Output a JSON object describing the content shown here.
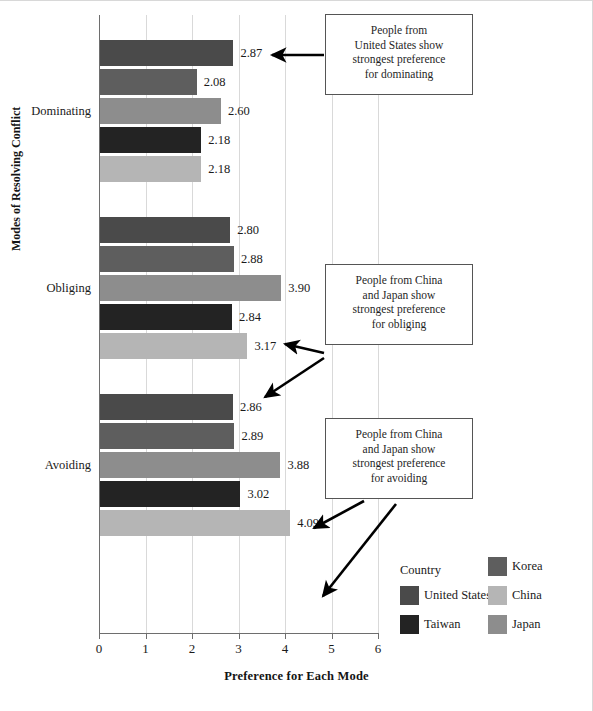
{
  "chart_data": {
    "type": "bar",
    "orientation": "horizontal",
    "title": "",
    "xlabel": "Preference for Each Mode",
    "ylabel": "Modes of Resolving Conflict",
    "categories": [
      "Dominating",
      "Obliging",
      "Avoiding"
    ],
    "xlim": [
      0,
      6
    ],
    "xticks": [
      "0",
      "1",
      "2",
      "3",
      "4",
      "5",
      "6"
    ],
    "grid": true,
    "legend_position": "bottom-right",
    "legend_title": "Country",
    "series": [
      {
        "name": "United States",
        "color": "#4a4a4a",
        "values": [
          2.87,
          2.8,
          2.86
        ]
      },
      {
        "name": "Korea",
        "color": "#5e5e5e",
        "values": [
          2.08,
          2.88,
          2.89
        ]
      },
      {
        "name": "Japan",
        "color": "#8d8d8d",
        "values": [
          2.6,
          3.9,
          3.88
        ]
      },
      {
        "name": "Taiwan",
        "color": "#232323",
        "values": [
          2.18,
          2.84,
          3.02
        ]
      },
      {
        "name": "China",
        "color": "#b5b5b5",
        "values": [
          2.18,
          3.17,
          4.09
        ]
      }
    ],
    "bar_value_labels": [
      [
        "2.87",
        "2.08",
        "2.60",
        "2.18",
        "2.18"
      ],
      [
        "2.80",
        "2.88",
        "3.90",
        "2.84",
        "3.17"
      ],
      [
        "2.86",
        "2.89",
        "3.88",
        "3.02",
        "4.09"
      ]
    ],
    "annotations": [
      {
        "id": "dominating-note",
        "lines": [
          "People from",
          "United States show",
          "strongest preference",
          "for dominating"
        ],
        "points_to": [
          "2.87"
        ]
      },
      {
        "id": "obliging-note",
        "lines": [
          "People from China",
          "and Japan show",
          "strongest preference",
          "for obliging"
        ],
        "points_to": [
          "3.90",
          "3.17"
        ]
      },
      {
        "id": "avoiding-note",
        "lines": [
          "People from China",
          "and Japan show",
          "strongest preference",
          "for avoiding"
        ],
        "points_to": [
          "3.88",
          "4.09"
        ]
      }
    ]
  },
  "legend": {
    "title": "Country",
    "entries": [
      {
        "label": "United States",
        "color": "#4a4a4a",
        "col": 0,
        "row": 1
      },
      {
        "label": "Taiwan",
        "color": "#232323",
        "col": 0,
        "row": 2
      },
      {
        "label": "Korea",
        "color": "#5e5e5e",
        "col": 1,
        "row": 0
      },
      {
        "label": "China",
        "color": "#b5b5b5",
        "col": 1,
        "row": 1
      },
      {
        "label": "Japan",
        "color": "#8d8d8d",
        "col": 1,
        "row": 2
      }
    ]
  }
}
